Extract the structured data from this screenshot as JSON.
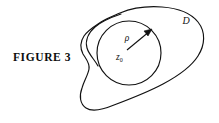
{
  "figure": {
    "caption": "FIGURE 3",
    "labels": {
      "region": "D",
      "radius": "ρ",
      "center": "z",
      "center_subscript": "0"
    },
    "colors": {
      "background": "#ffffff",
      "stroke": "#111111",
      "text": "#0d0d0d"
    },
    "geometry": {
      "circle_center_x": 129,
      "circle_center_y": 53,
      "circle_radius": 32,
      "radius_arrow_from": [
        127,
        50
      ],
      "radius_arrow_to": [
        152,
        29
      ]
    }
  }
}
